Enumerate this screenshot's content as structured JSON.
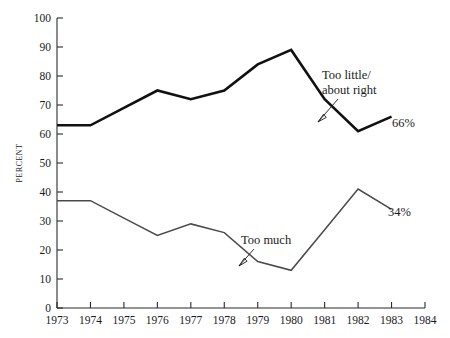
{
  "chart_data": {
    "type": "line",
    "title": "",
    "subtitle": "",
    "xlabel": "",
    "ylabel": "PERCENT",
    "xlim": [
      1973,
      1984
    ],
    "ylim": [
      0,
      100
    ],
    "grid": false,
    "legend_position": "inline-annotation",
    "x": [
      1973,
      1974,
      1975,
      1976,
      1977,
      1978,
      1979,
      1980,
      1981,
      1982,
      1983
    ],
    "xticks": [
      "1973",
      "1974",
      "1975",
      "1976",
      "1977",
      "1978",
      "1979",
      "1980",
      "1981",
      "1982",
      "1983",
      "1984"
    ],
    "yticks": [
      "0",
      "10",
      "20",
      "30",
      "40",
      "50",
      "60",
      "70",
      "80",
      "90",
      "100"
    ],
    "series": [
      {
        "name": "Too little/about right",
        "label_line_1": "Too little/",
        "label_line_2": "about right",
        "end_value_label": "66%",
        "color": "#111111",
        "values": [
          63,
          63,
          69,
          75,
          72,
          75,
          84,
          89,
          72,
          61,
          66
        ]
      },
      {
        "name": "Too much",
        "label_line_1": "Too much",
        "label_line_2": "",
        "end_value_label": "34%",
        "color": "#4a4a4a",
        "values": [
          37,
          37,
          31,
          25,
          29,
          26,
          16,
          13,
          27,
          41,
          34
        ]
      }
    ],
    "annotations": [
      {
        "text": "Too little/ about right",
        "x": 1981.0,
        "y": 77
      },
      {
        "text": "Too much",
        "x": 1978.7,
        "y": 25
      },
      {
        "text": "66%",
        "x": 1983.4,
        "y": 63
      },
      {
        "text": "34%",
        "x": 1983.4,
        "y": 37
      }
    ]
  }
}
